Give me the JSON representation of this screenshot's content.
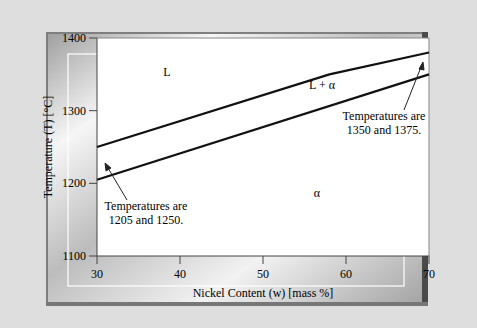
{
  "chart_data": {
    "type": "line",
    "title": "",
    "xlabel": "Nickel Content (w) [mass %]",
    "ylabel": "Temperature (T) [°C]",
    "xlim": [
      30,
      70
    ],
    "ylim": [
      1100,
      1400
    ],
    "xticks": [
      "30",
      "40",
      "50",
      "60",
      "70"
    ],
    "yticks": [
      "1100",
      "1200",
      "1300",
      "1400"
    ],
    "grid": false,
    "series": [
      {
        "name": "Liquidus",
        "x": [
          30,
          58,
          70
        ],
        "y": [
          1250,
          1350,
          1380
        ]
      },
      {
        "name": "Solidus",
        "x": [
          30,
          70
        ],
        "y": [
          1205,
          1350
        ]
      }
    ],
    "regions": [
      {
        "label": "L"
      },
      {
        "label": "L + α"
      },
      {
        "label": "α"
      }
    ],
    "annotations": [
      {
        "line1": "Temperatures are",
        "line2": "1350 and 1375."
      },
      {
        "line1": "Temperatures are",
        "line2": "1205 and 1250."
      }
    ]
  }
}
